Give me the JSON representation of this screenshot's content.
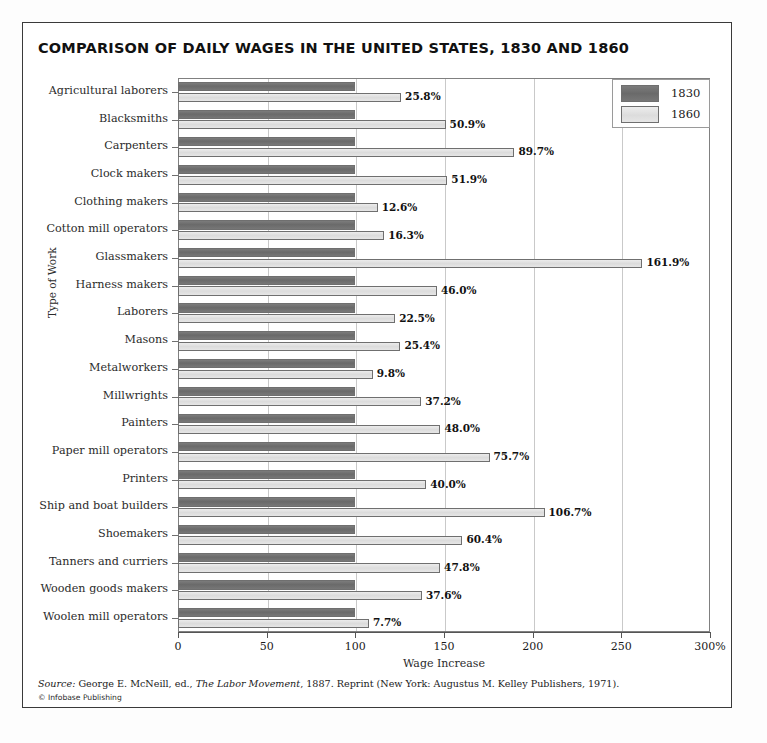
{
  "title": "COMPARISON OF DAILY WAGES IN THE UNITED STATES, 1830 AND 1860",
  "legend": {
    "items": [
      {
        "label": "1830",
        "color": "#6a6a6a"
      },
      {
        "label": "1860",
        "color": "#dcdcdc"
      }
    ]
  },
  "axes": {
    "ylabel": "Type of Work",
    "xlabel": "Wage Increase",
    "xticks": [
      "0",
      "50",
      "100",
      "150",
      "200",
      "250",
      "300%"
    ],
    "xtick_values": [
      0,
      50,
      100,
      150,
      200,
      250,
      300
    ]
  },
  "source": {
    "lead": "Source:",
    "text_before": " George E. McNeill, ed., ",
    "work": "The Labor Movement",
    "text_after": ", 1887. Reprint (New York: Augustus M. Kelley Publishers, 1971).",
    "copyright": "© Infobase Publishing"
  },
  "chart_data": {
    "type": "bar",
    "orientation": "horizontal",
    "title": "COMPARISON OF DAILY WAGES IN THE UNITED STATES, 1830 AND 1860",
    "xlabel": "Wage Increase",
    "ylabel": "Type of Work",
    "xlim": [
      0,
      300
    ],
    "grid": true,
    "legend_position": "top-right",
    "categories": [
      "Agricultural laborers",
      "Blacksmiths",
      "Carpenters",
      "Clock makers",
      "Clothing makers",
      "Cotton mill operators",
      "Glassmakers",
      "Harness makers",
      "Laborers",
      "Masons",
      "Metalworkers",
      "Millwrights",
      "Painters",
      "Paper mill operators",
      "Printers",
      "Ship and boat builders",
      "Shoemakers",
      "Tanners and curriers",
      "Wooden goods makers",
      "Woolen mill operators"
    ],
    "series": [
      {
        "name": "1830",
        "color": "#6a6a6a",
        "values": [
          100,
          100,
          100,
          100,
          100,
          100,
          100,
          100,
          100,
          100,
          100,
          100,
          100,
          100,
          100,
          100,
          100,
          100,
          100,
          100
        ]
      },
      {
        "name": "1860",
        "color": "#dcdcdc",
        "values": [
          125.8,
          150.9,
          189.7,
          151.9,
          112.6,
          116.3,
          261.9,
          146.0,
          122.5,
          125.4,
          109.8,
          137.2,
          148.0,
          175.7,
          140.0,
          206.7,
          160.4,
          147.8,
          137.6,
          107.7
        ]
      }
    ],
    "data_labels": [
      "25.8%",
      "50.9%",
      "89.7%",
      "51.9%",
      "12.6%",
      "16.3%",
      "161.9%",
      "46.0%",
      "22.5%",
      "25.4%",
      "9.8%",
      "37.2%",
      "48.0%",
      "75.7%",
      "40.0%",
      "106.7%",
      "60.4%",
      "47.8%",
      "37.6%",
      "7.7%"
    ],
    "wage_increase_percent": [
      25.8,
      50.9,
      89.7,
      51.9,
      12.6,
      16.3,
      161.9,
      46.0,
      22.5,
      25.4,
      9.8,
      37.2,
      48.0,
      75.7,
      40.0,
      106.7,
      60.4,
      47.8,
      37.6,
      7.7
    ]
  }
}
